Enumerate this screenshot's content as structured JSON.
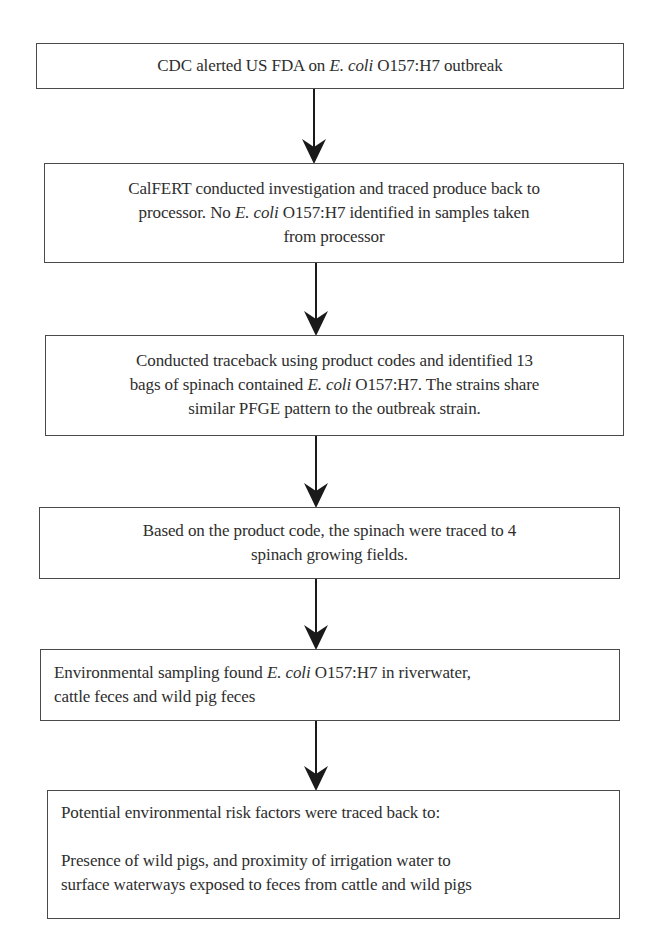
{
  "flowchart": {
    "steps": [
      {
        "id": "cdc-alert",
        "parts": [
          {
            "text": "CDC alerted US FDA  on "
          },
          {
            "text": "E. coli",
            "italic": true
          },
          {
            "text": "  O157:H7 outbreak"
          }
        ]
      },
      {
        "id": "calfert-investigation",
        "lines": [
          [
            {
              "text": "CalFERT conducted investigation and traced produce back to"
            }
          ],
          [
            {
              "text": "processor. No "
            },
            {
              "text": "E. coli",
              "italic": true
            },
            {
              "text": "  O157:H7 identified in samples taken"
            }
          ],
          [
            {
              "text": "from processor"
            }
          ]
        ]
      },
      {
        "id": "traceback-product-codes",
        "lines": [
          [
            {
              "text": "Conducted traceback using product codes and identified 13"
            }
          ],
          [
            {
              "text": "bags of spinach contained "
            },
            {
              "text": "E. coli",
              "italic": true
            },
            {
              "text": "  O157:H7. The strains share"
            }
          ],
          [
            {
              "text": "similar PFGE pattern to  the outbreak strain."
            }
          ]
        ]
      },
      {
        "id": "traced-to-fields",
        "lines": [
          [
            {
              "text": "Based on the product code, the spinach were traced to 4"
            }
          ],
          [
            {
              "text": "spinach growing fields."
            }
          ]
        ]
      },
      {
        "id": "environmental-sampling",
        "lines": [
          [
            {
              "text": "Environmental sampling found "
            },
            {
              "text": "E. coli",
              "italic": true
            },
            {
              "text": "  O157:H7 in riverwater,"
            }
          ],
          [
            {
              "text": "cattle feces and wild pig feces"
            }
          ]
        ]
      },
      {
        "id": "risk-factors",
        "heading": "Potential environmental risk factors were traced back to:",
        "lines": [
          [
            {
              "text": "Presence of wild pigs, and proximity of irrigation water to"
            }
          ],
          [
            {
              "text": "surface waterways exposed to feces from cattle and wild pigs"
            }
          ]
        ]
      }
    ],
    "arrow_count": 5,
    "colors": {
      "border": "#4a4a4a",
      "text": "#2e2e2e",
      "arrow": "#1a1a1a",
      "background": "#ffffff"
    }
  }
}
